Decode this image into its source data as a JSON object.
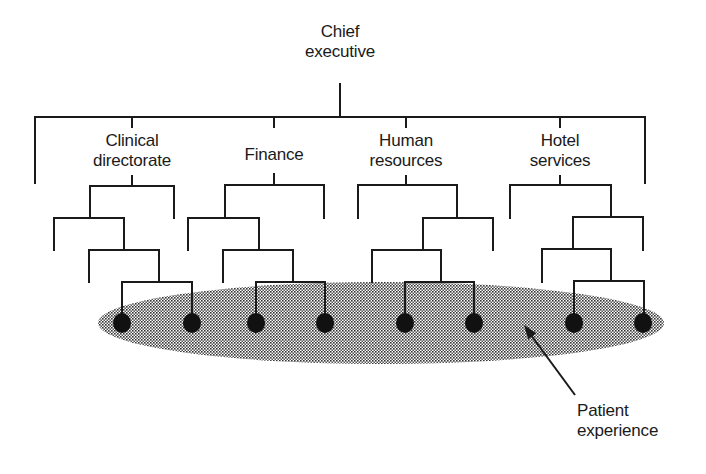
{
  "diagram": {
    "type": "organisational hierarchy with patient experience overlay",
    "colors": {
      "line": "#1a1a1a",
      "node": "#111111",
      "ellipse_fill": "#8a8a8a",
      "background": "#ffffff"
    },
    "root": {
      "id": "chief-executive",
      "line1": "Chief",
      "line2": "executive",
      "x": 340,
      "y": 22
    },
    "departments": [
      {
        "id": "clinical-directorate",
        "line1": "Clinical",
        "line2": "directorate",
        "x": 132,
        "y": 131
      },
      {
        "id": "finance",
        "line1": "Finance",
        "line2": "",
        "x": 274,
        "y": 145
      },
      {
        "id": "human-resources",
        "line1": "Human",
        "line2": "resources",
        "x": 406,
        "y": 131
      },
      {
        "id": "hotel-services",
        "line1": "Hotel",
        "line2": "services",
        "x": 560,
        "y": 131
      }
    ],
    "callout": {
      "id": "patient-experience",
      "line1": "Patient",
      "line2": "experience",
      "x": 577,
      "y": 401,
      "arrow": {
        "x1": 575,
        "y1": 395,
        "x2": 524,
        "y2": 325
      }
    },
    "ellipse": {
      "cx": 381,
      "cy": 323,
      "rx": 283,
      "ry": 41
    },
    "nodes": [
      {
        "x": 122,
        "y": 323
      },
      {
        "x": 192,
        "y": 323
      },
      {
        "x": 256,
        "y": 323
      },
      {
        "x": 325,
        "y": 323
      },
      {
        "x": 405,
        "y": 323
      },
      {
        "x": 474,
        "y": 323
      },
      {
        "x": 574,
        "y": 323
      },
      {
        "x": 643,
        "y": 323
      }
    ],
    "lines": [
      [
        340,
        84,
        340,
        117
      ],
      [
        35,
        117,
        645,
        117
      ],
      [
        35,
        117,
        35,
        183
      ],
      [
        645,
        117,
        645,
        183
      ],
      [
        132,
        117,
        132,
        127
      ],
      [
        274,
        117,
        274,
        127
      ],
      [
        406,
        117,
        406,
        127
      ],
      [
        560,
        117,
        560,
        127
      ],
      [
        132,
        176,
        132,
        186
      ],
      [
        90,
        186,
        174,
        186
      ],
      [
        174,
        186,
        174,
        218
      ],
      [
        90,
        186,
        90,
        218
      ],
      [
        54,
        218,
        124,
        218
      ],
      [
        54,
        218,
        54,
        250
      ],
      [
        124,
        218,
        124,
        250
      ],
      [
        89,
        250,
        159,
        250
      ],
      [
        89,
        250,
        89,
        282
      ],
      [
        159,
        250,
        159,
        282
      ],
      [
        122,
        282,
        192,
        282
      ],
      [
        122,
        282,
        122,
        323
      ],
      [
        192,
        282,
        192,
        323
      ],
      [
        274,
        174,
        274,
        185
      ],
      [
        225,
        185,
        324,
        185
      ],
      [
        324,
        185,
        324,
        218
      ],
      [
        225,
        185,
        225,
        218
      ],
      [
        188,
        218,
        259,
        218
      ],
      [
        188,
        218,
        188,
        250
      ],
      [
        259,
        218,
        259,
        250
      ],
      [
        223,
        250,
        293,
        250
      ],
      [
        223,
        250,
        223,
        282
      ],
      [
        293,
        250,
        293,
        282
      ],
      [
        256,
        282,
        325,
        282
      ],
      [
        256,
        282,
        256,
        323
      ],
      [
        325,
        282,
        325,
        323
      ],
      [
        406,
        176,
        406,
        185
      ],
      [
        358,
        185,
        457,
        185
      ],
      [
        358,
        185,
        358,
        218
      ],
      [
        457,
        185,
        457,
        218
      ],
      [
        423,
        218,
        493,
        218
      ],
      [
        493,
        218,
        493,
        250
      ],
      [
        423,
        218,
        423,
        250
      ],
      [
        372,
        250,
        441,
        250
      ],
      [
        372,
        250,
        372,
        282
      ],
      [
        441,
        250,
        441,
        282
      ],
      [
        405,
        282,
        474,
        282
      ],
      [
        405,
        282,
        405,
        323
      ],
      [
        474,
        282,
        474,
        323
      ],
      [
        560,
        176,
        560,
        185
      ],
      [
        510,
        185,
        611,
        185
      ],
      [
        510,
        185,
        510,
        218
      ],
      [
        611,
        185,
        611,
        217
      ],
      [
        573,
        217,
        643,
        217
      ],
      [
        643,
        217,
        643,
        250
      ],
      [
        573,
        217,
        573,
        249
      ],
      [
        542,
        249,
        611,
        249
      ],
      [
        542,
        249,
        542,
        282
      ],
      [
        611,
        249,
        611,
        281
      ],
      [
        574,
        281,
        644,
        281
      ],
      [
        574,
        281,
        574,
        323
      ],
      [
        644,
        281,
        644,
        323
      ]
    ]
  }
}
